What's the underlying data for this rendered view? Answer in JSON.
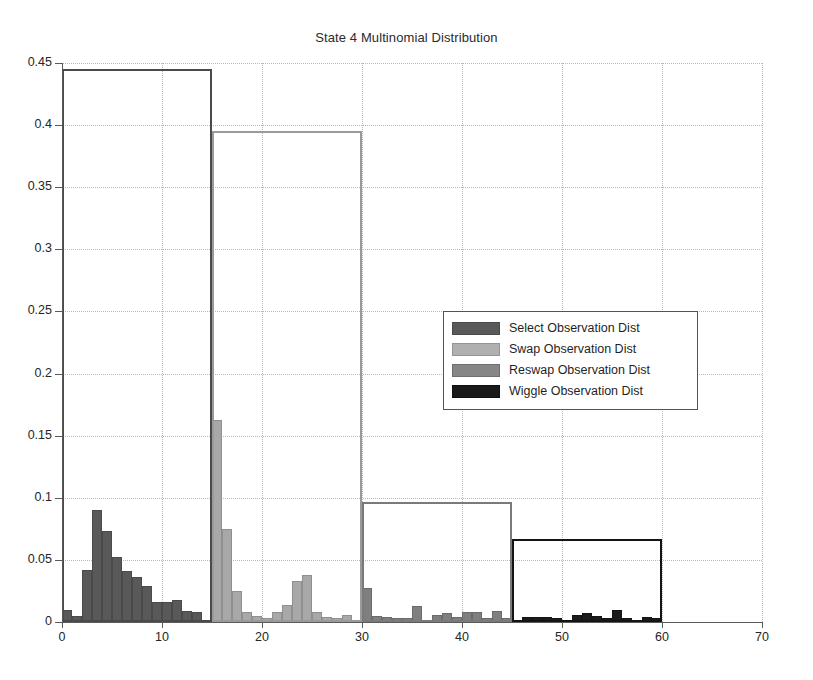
{
  "chart_data": {
    "type": "bar",
    "title": "State 4 Multinomial Distribution",
    "xlabel": "",
    "ylabel": "",
    "xlim": [
      0,
      70
    ],
    "ylim": [
      0,
      0.45
    ],
    "xticks": [
      0,
      10,
      20,
      30,
      40,
      50,
      60,
      70
    ],
    "yticks": [
      0,
      0.05,
      0.1,
      0.15,
      0.2,
      0.25,
      0.3,
      0.35,
      0.4,
      0.45
    ],
    "grid": true,
    "legend_position": "center",
    "series": [
      {
        "name": "Select Observation Dist",
        "color": "#595959",
        "bin_start": 1,
        "bin_end": 15,
        "x": [
          1,
          2,
          3,
          4,
          5,
          6,
          7,
          8,
          9,
          10,
          11,
          12,
          13,
          14,
          15
        ],
        "values": [
          0.01,
          0.005,
          0.042,
          0.09,
          0.073,
          0.052,
          0.041,
          0.036,
          0.029,
          0.016,
          0.016,
          0.018,
          0.009,
          0.008,
          0.002
        ],
        "group_total": 0.445
      },
      {
        "name": "Swap Observation Dist",
        "color": "#a8a8a8",
        "bin_start": 16,
        "bin_end": 30,
        "x": [
          16,
          17,
          18,
          19,
          20,
          21,
          22,
          23,
          24,
          25,
          26,
          27,
          28,
          29,
          30
        ],
        "values": [
          0.163,
          0.075,
          0.025,
          0.008,
          0.005,
          0.003,
          0.008,
          0.014,
          0.033,
          0.038,
          0.008,
          0.004,
          0.003,
          0.006,
          0.002
        ],
        "group_total": 0.395
      },
      {
        "name": "Reswap Observation Dist",
        "color": "#7f7f7f",
        "bin_start": 31,
        "bin_end": 45,
        "x": [
          31,
          32,
          33,
          34,
          35,
          36,
          37,
          38,
          39,
          40,
          41,
          42,
          43,
          44,
          45
        ],
        "values": [
          0.027,
          0.005,
          0.004,
          0.003,
          0.003,
          0.013,
          0.002,
          0.006,
          0.007,
          0.004,
          0.008,
          0.008,
          0.003,
          0.009,
          0.003
        ],
        "group_total": 0.097
      },
      {
        "name": "Wiggle Observation Dist",
        "color": "#1c1c1c",
        "bin_start": 46,
        "bin_end": 60,
        "x": [
          46,
          47,
          48,
          49,
          50,
          51,
          52,
          53,
          54,
          55,
          56,
          57,
          58,
          59,
          60
        ],
        "values": [
          0.002,
          0.004,
          0.004,
          0.004,
          0.003,
          0.002,
          0.006,
          0.007,
          0.005,
          0.003,
          0.01,
          0.003,
          0.002,
          0.004,
          0.003
        ],
        "group_total": 0.067
      }
    ],
    "group_boxes": [
      {
        "name": "Select Observation Dist",
        "x0": 1,
        "x1": 15,
        "top": 0.445,
        "color": "#4a4a4a"
      },
      {
        "name": "Swap Observation Dist",
        "x0": 16,
        "x1": 30,
        "top": 0.395,
        "color": "#9a9a9a"
      },
      {
        "name": "Reswap Observation Dist",
        "x0": 31,
        "x1": 45,
        "top": 0.097,
        "color": "#7a7a7a"
      },
      {
        "name": "Wiggle Observation Dist",
        "x0": 46,
        "x1": 60,
        "top": 0.067,
        "color": "#141414"
      }
    ]
  },
  "legend": {
    "items": [
      {
        "label": "Select Observation Dist",
        "key": "select"
      },
      {
        "label": "Swap Observation Dist",
        "key": "swap"
      },
      {
        "label": "Reswap Observation Dist",
        "key": "reswap"
      },
      {
        "label": "Wiggle Observation Dist",
        "key": "wiggle"
      }
    ]
  },
  "axis": {
    "y_tick_labels": [
      "0",
      "0.05",
      "0.1",
      "0.15",
      "0.2",
      "0.25",
      "0.3",
      "0.35",
      "0.4",
      "0.45"
    ],
    "x_tick_labels": [
      "0",
      "10",
      "20",
      "30",
      "40",
      "50",
      "60",
      "70"
    ]
  }
}
